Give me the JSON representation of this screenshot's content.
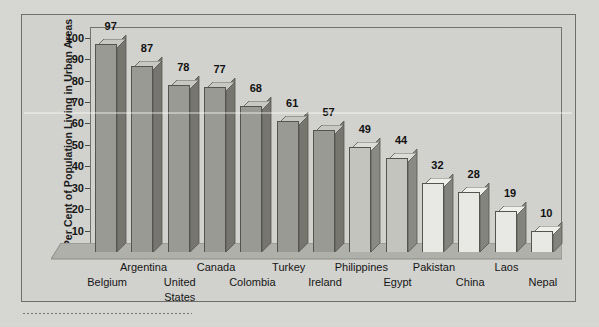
{
  "chart_data": {
    "type": "bar",
    "title": "",
    "subtitle": "",
    "xlabel": "",
    "ylabel": "Per Cent of Population Living in Urban Areas",
    "ylim": [
      0,
      105
    ],
    "yticks": [
      10,
      20,
      30,
      40,
      50,
      60,
      70,
      80,
      90,
      100
    ],
    "grid": false,
    "legend": null,
    "categories": [
      "Belgium",
      "Argentina",
      "United States",
      "Canada",
      "Colombia",
      "Turkey",
      "Ireland",
      "Philippines",
      "Egypt",
      "Pakistan",
      "China",
      "Laos",
      "Nepal"
    ],
    "values": [
      97,
      87,
      78,
      77,
      68,
      61,
      57,
      49,
      44,
      32,
      28,
      19,
      10
    ],
    "bar_shades": [
      "dark",
      "dark",
      "dark",
      "dark",
      "dark",
      "dark",
      "dark",
      "mid",
      "mid",
      "light",
      "light",
      "light",
      "light"
    ],
    "annotations": []
  },
  "label_rows": [
    {
      "category": "Belgium",
      "row": 1
    },
    {
      "category": "Argentina",
      "row": 0
    },
    {
      "category": "United States",
      "row": 1
    },
    {
      "category": "Canada",
      "row": 0
    },
    {
      "category": "Colombia",
      "row": 1
    },
    {
      "category": "Turkey",
      "row": 0
    },
    {
      "category": "Ireland",
      "row": 1
    },
    {
      "category": "Philippines",
      "row": 0
    },
    {
      "category": "Egypt",
      "row": 1
    },
    {
      "category": "Pakistan",
      "row": 0
    },
    {
      "category": "China",
      "row": 1
    },
    {
      "category": "Laos",
      "row": 0
    },
    {
      "category": "Nepal",
      "row": 1
    }
  ],
  "colors": {
    "page_background": "#d7d7d3",
    "frame_background": "#d2d2ce",
    "frame_border": "#6e6e6a",
    "plot_border": "#72726e",
    "bar_dark_front": "#9a9a95",
    "bar_dark_side": "#76766f",
    "bar_dark_top": "#c8c8c3",
    "bar_mid_front": "#c4c4bf",
    "bar_mid_side": "#8a8a84",
    "bar_mid_top": "#dcdcd8",
    "bar_light_front": "#e8e8e4",
    "bar_light_side": "#84847e",
    "bar_light_top": "#efefec",
    "floor_top": "#b0b0aa",
    "floor_edge": "#8c8c86",
    "text": "#141414"
  }
}
